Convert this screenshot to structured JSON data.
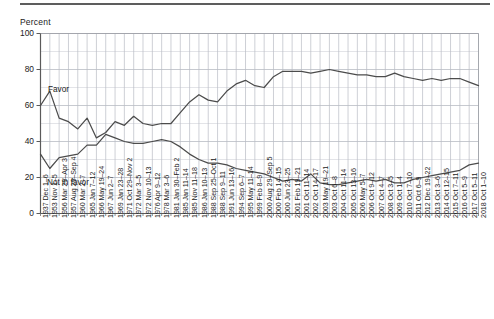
{
  "figure": {
    "top_rule": true,
    "y_axis_title": "Percent"
  },
  "chart_data": {
    "type": "line",
    "title": "",
    "subtitle": "",
    "xlabel": "",
    "ylabel": "Percent",
    "ylim": [
      0,
      100
    ],
    "yticks": [
      0,
      20,
      40,
      60,
      80,
      100
    ],
    "y_minor_step": 10,
    "grid": true,
    "legend_position": "inline-annotations",
    "annotations": [
      {
        "text": "Favor",
        "series": "Favor"
      },
      {
        "text": "Not in favor",
        "series": "Not in favor"
      }
    ],
    "categories": [
      "1937 Dec 1–6",
      "1953 Nov 1–5",
      "1956 Mar 29–Apr 3",
      "1957 Aug 29–Sep 4",
      "1960 Mar 2–7",
      "1965 Jan 7–12",
      "1966 May 19–24",
      "1967 Jun 2–7",
      "1969 Jan 23–28",
      "1971 Oct 29–Nov 2",
      "1972 Mar 3–5",
      "1972 Nov 10–13",
      "1976 Apr 9–12",
      "1978 Mar 3–6",
      "1981 Jan 30–Feb 2",
      "1985 Jan 11–14",
      "1985 Nov 11–18",
      "1986 Jan 10–13",
      "1988 Sep 25–Oct 1",
      "1988 Sep 9–11",
      "1991 Jun 13–16",
      "1994 Sep 6–7",
      "1995 May 11–14",
      "1999 Feb 8–9",
      "2000 Aug 29–Sep 5",
      "2000 Feb 14–15",
      "2000 Jun 23–25",
      "2001 Feb 19–21",
      "2001 Oct 11–14",
      "2002 Oct 14–17",
      "2003 May 19–21",
      "2003 Oct 6–8",
      "2004 Oct 11–14",
      "2005 Oct 13–16",
      "2006 May 5–7",
      "2006 Oct 9–12",
      "2007 Oct 4–7",
      "2008 Oct 3–5",
      "2009 Oct 1–4",
      "2010 Oct 7–10",
      "2011 Oct 6–9",
      "2012 Dec 19–22",
      "2013 Oct 3–6",
      "2014 Oct 12–15",
      "2015 Oct 7–11",
      "2016 Oct 5–9",
      "2017 Oct 5–11",
      "2018 Oct 1–10"
    ],
    "series": [
      {
        "name": "Favor",
        "color": "#4c4c4c",
        "values": [
          60,
          68,
          53,
          51,
          47,
          53,
          42,
          45,
          51,
          49,
          54,
          50,
          49,
          50,
          50,
          56,
          62,
          66,
          63,
          62,
          68,
          72,
          74,
          71,
          70,
          76,
          79,
          79,
          79,
          78,
          79,
          80,
          79,
          78,
          77,
          77,
          76,
          76,
          78,
          76,
          75,
          74,
          75,
          74,
          75,
          75,
          73,
          71
        ]
      },
      {
        "name": "Not in favor",
        "color": "#4c4c4c",
        "values": [
          33,
          25,
          31,
          32,
          33,
          38,
          38,
          44,
          42,
          40,
          39,
          39,
          40,
          41,
          40,
          37,
          33,
          30,
          28,
          28,
          27,
          25,
          24,
          23,
          22,
          20,
          18,
          19,
          18,
          22,
          17,
          16,
          16,
          17,
          18,
          19,
          18,
          19,
          17,
          17,
          19,
          20,
          21,
          22,
          23,
          24,
          27,
          28
        ]
      }
    ]
  }
}
